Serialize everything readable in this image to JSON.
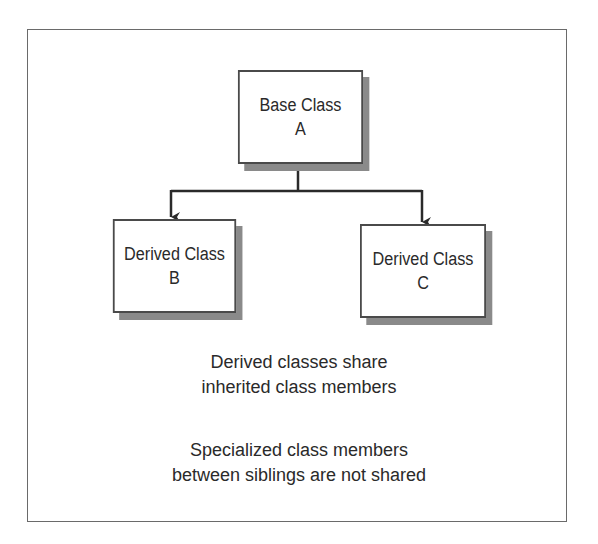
{
  "diagram": {
    "type": "class-inheritance",
    "nodes": [
      {
        "id": "A",
        "line1": "Base Class",
        "line2": "A"
      },
      {
        "id": "B",
        "line1": "Derived Class",
        "line2": "B"
      },
      {
        "id": "C",
        "line1": "Derived Class",
        "line2": "C"
      }
    ],
    "edges": [
      {
        "from": "A",
        "to": "B",
        "style": "arrow"
      },
      {
        "from": "A",
        "to": "C",
        "style": "arrow"
      }
    ],
    "captions": [
      {
        "line1": "Derived classes share",
        "line2": "inherited class members"
      },
      {
        "line1": "Specialized class members",
        "line2": "between siblings are not shared"
      }
    ],
    "colors": {
      "border": "#4a4a4a",
      "shadow": "#8a8a8a",
      "frame": "#6a6a6a",
      "text": "#2a2a2a"
    }
  }
}
